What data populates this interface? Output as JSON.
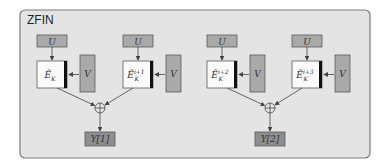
{
  "frame": {
    "title": "ZFIN",
    "colors": {
      "background": "#e4e4e4",
      "border": "#7a7a7a",
      "input_box": "#a9a9a9",
      "input_border": "#5a5a5a",
      "estimator_box": "#fafafa",
      "estimator_bar": "#111111",
      "output_box": "#8e8e8e",
      "arrow": "#444444"
    }
  },
  "blocks": [
    {
      "u_label": "U",
      "v_label": "V",
      "e_base": "Ẽ",
      "e_sub": "K",
      "e_sup": ""
    },
    {
      "u_label": "U",
      "v_label": "V",
      "e_base": "Ẽ",
      "e_sub": "K",
      "e_sup": "i+1"
    },
    {
      "u_label": "U",
      "v_label": "V",
      "e_base": "Ẽ",
      "e_sub": "K",
      "e_sup": "i+2"
    },
    {
      "u_label": "U",
      "v_label": "V",
      "e_base": "Ẽ",
      "e_sub": "K",
      "e_sup": "i+3"
    }
  ],
  "combiners": [
    {
      "symbol": "⊕",
      "output_label": "Y[1]"
    },
    {
      "symbol": "⊕",
      "output_label": "Y[2]"
    }
  ]
}
